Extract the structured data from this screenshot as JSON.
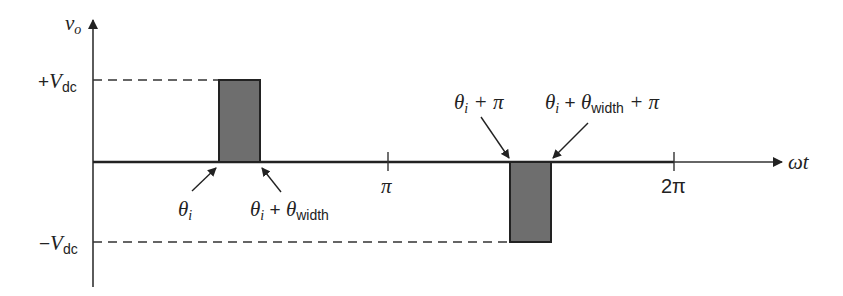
{
  "diagram": {
    "type": "waveform",
    "y_axis_label": {
      "base": "v",
      "sub": "o"
    },
    "x_axis_label": "ωt",
    "levels": {
      "positive": {
        "sign": "+",
        "base": "V",
        "sub": "dc"
      },
      "negative": {
        "sign": "−",
        "base": "V",
        "sub": "dc"
      }
    },
    "ticks": [
      {
        "label": "π"
      },
      {
        "label": "2π"
      }
    ],
    "annotations": {
      "pulse1_start": {
        "theta": "θ",
        "sub": "i"
      },
      "pulse1_end": {
        "theta": "θ",
        "sub": "i",
        "plus": " + ",
        "theta2": "θ",
        "sub2": "width"
      },
      "pulse2_start": {
        "theta": "θ",
        "sub": "i",
        "rest": " + π"
      },
      "pulse2_end": {
        "theta": "θ",
        "sub": "i",
        "plus": " + ",
        "theta2": "θ",
        "sub2": "width",
        "rest": " + π"
      }
    },
    "pulses": [
      {
        "polarity": "positive",
        "start": "θi",
        "end": "θi + θwidth",
        "level": "+Vdc"
      },
      {
        "polarity": "negative",
        "start": "θi + π",
        "end": "θi + θwidth + π",
        "level": "−Vdc"
      }
    ],
    "colors": {
      "pulse_fill": "#6e6e6e",
      "line": "#222222"
    }
  }
}
